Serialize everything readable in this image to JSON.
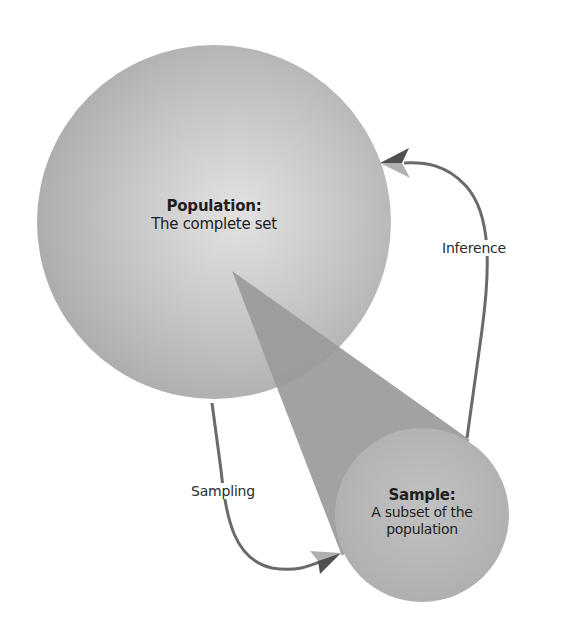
{
  "diagram": {
    "type": "sampling-inference-flow",
    "nodes": [
      {
        "id": "population",
        "title": "Population:",
        "description": "The complete set",
        "shape": "circle",
        "fill": "#bdbdbd"
      },
      {
        "id": "sample",
        "title": "Sample:",
        "description_line1": "A subset of the",
        "description_line2": "population",
        "shape": "circle",
        "fill": "#b4b4b4"
      }
    ],
    "edges": [
      {
        "from": "population",
        "to": "sample",
        "label": "Sampling"
      },
      {
        "from": "sample",
        "to": "population",
        "label": "Inference"
      }
    ],
    "colors": {
      "population_fill": "#bdbdbd",
      "population_highlight": "#dcdcdc",
      "sample_fill": "#b6b6b6",
      "cone_fill": "#9a9a9a",
      "arrow_stroke": "#6a6a6a",
      "arrowhead_dark": "#505050",
      "arrowhead_light": "#b0b0b0",
      "text": "#1e1e1e",
      "background": "#ffffff"
    }
  },
  "labels": {
    "population_title": "Population:",
    "population_desc": "The complete set",
    "sample_title": "Sample:",
    "sample_desc_1": "A subset of the",
    "sample_desc_2": "population",
    "inference": "Inference",
    "sampling": "Sampling"
  }
}
